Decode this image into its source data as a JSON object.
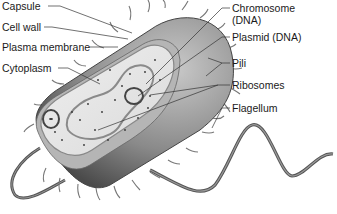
{
  "diagram": {
    "labels_left": [
      {
        "id": "capsule",
        "text": "Capsule"
      },
      {
        "id": "cell-wall",
        "text": "Cell wall"
      },
      {
        "id": "plasma-membrane",
        "text": "Plasma membrane"
      },
      {
        "id": "cytoplasm",
        "text": "Cytoplasm"
      }
    ],
    "labels_right": [
      {
        "id": "chromosome",
        "text": "Chromosome",
        "text2": "(DNA)"
      },
      {
        "id": "plasmid",
        "text": "Plasmid (DNA)"
      },
      {
        "id": "pili",
        "text": "Pili"
      },
      {
        "id": "ribosomes",
        "text": "Ribosomes"
      },
      {
        "id": "flagellum",
        "text": "Flagellum"
      }
    ],
    "colors": {
      "capsule_dark": "#5a5a5a",
      "capsule_light": "#b8b8b8",
      "cytoplasm": "#e6e6e6",
      "line": "#333333",
      "text": "#1a1a1a"
    }
  }
}
